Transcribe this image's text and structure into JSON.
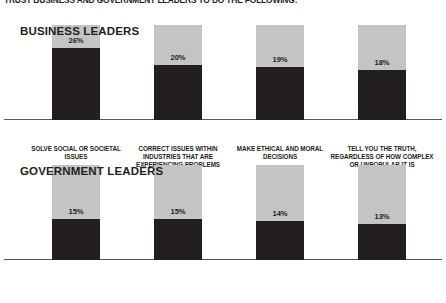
{
  "headline": "TRUST BUSINESS AND GOVERNMENT LEADERS TO DO THE FOLLOWING:",
  "colors": {
    "bar_track": "#c4c4c4",
    "bar_fill": "#231f20",
    "text": "#231f20",
    "baseline": "#58585b",
    "background": "#ffffff"
  },
  "sections": [
    {
      "title": "BUSINESS LEADERS",
      "bars": [
        {
          "value": 26,
          "label": "26%",
          "caption": [
            "SOLVE SOCIAL OR SOCIETAL",
            "ISSUES"
          ]
        },
        {
          "value": 20,
          "label": "20%",
          "caption": [
            "CORRECT ISSUES WITHIN",
            "INDUSTRIES THAT ARE",
            "EXPERIENCING PROBLEMS"
          ]
        },
        {
          "value": 19,
          "label": "19%",
          "caption": [
            "MAKE ETHICAL AND MORAL",
            "DECISIONS"
          ]
        },
        {
          "value": 18,
          "label": "18%",
          "caption": [
            "TELL YOU THE TRUTH,",
            "REGARDLESS OF HOW COMPLEX",
            "OR UNPOPULAR IT IS"
          ]
        }
      ]
    },
    {
      "title": "GOVERNMENT LEADERS",
      "bars": [
        {
          "value": 15,
          "label": "15%",
          "caption": [
            "SOLVE SOCIAL OR SOCIETAL",
            "ISSUES"
          ]
        },
        {
          "value": 15,
          "label": "15%",
          "caption": [
            "CORRECT ISSUES WITHIN",
            "INDUSTRIES THAT ARE",
            "EXPERIENCING PROBLEMS"
          ]
        },
        {
          "value": 14,
          "label": "14%",
          "caption": [
            "MAKE ETHICAL AND MORAL",
            "DECISIONS"
          ]
        },
        {
          "value": 13,
          "label": "13%",
          "caption": [
            "TELL YOU THE TRUTH,",
            "REGARDLESS OF HOW COMPLEX",
            "OR UNPOPULAR IT IS"
          ]
        }
      ]
    }
  ],
  "chart_data": {
    "type": "bar",
    "title": "TRUST BUSINESS AND GOVERNMENT LEADERS TO DO THE FOLLOWING:",
    "xlabel": "",
    "ylabel": "",
    "ylim": [
      0,
      100
    ],
    "grid": false,
    "legend": "none",
    "units": "percent",
    "orientation": "vertical",
    "categories": [
      "SOLVE SOCIAL OR SOCIETAL ISSUES",
      "CORRECT ISSUES WITHIN INDUSTRIES THAT ARE EXPERIENCING PROBLEMS",
      "MAKE ETHICAL AND MORAL DECISIONS",
      "TELL YOU THE TRUTH, REGARDLESS OF HOW COMPLEX OR UNPOPULAR IT IS"
    ],
    "series": [
      {
        "name": "BUSINESS LEADERS",
        "values": [
          26,
          20,
          19,
          18
        ]
      },
      {
        "name": "GOVERNMENT LEADERS",
        "values": [
          15,
          15,
          14,
          13
        ]
      }
    ],
    "annotations": [
      "Each bar is drawn as a full-height light grey track with a dark fill proportional to the percentage.",
      "Percentage label is placed immediately above the top of the dark fill."
    ]
  }
}
